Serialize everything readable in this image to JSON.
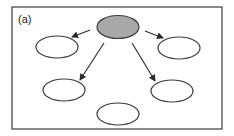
{
  "panel_label": "(a)",
  "colors": {
    "frame": "#4a4a4a",
    "root_fill": "#a8a8a8",
    "node_fill": "#ffffff",
    "edge": "#2a2a2a"
  },
  "nodes": [
    {
      "id": "root",
      "role": "source",
      "shaded": true,
      "label": ""
    },
    {
      "id": "top-left",
      "role": "target",
      "shaded": false,
      "label": ""
    },
    {
      "id": "top-right",
      "role": "target",
      "shaded": false,
      "label": ""
    },
    {
      "id": "mid-left",
      "role": "target",
      "shaded": false,
      "label": ""
    },
    {
      "id": "mid-right",
      "role": "target",
      "shaded": false,
      "label": ""
    },
    {
      "id": "bottom",
      "role": "isolated",
      "shaded": false,
      "label": ""
    }
  ],
  "edges": [
    {
      "from": "root",
      "to": "top-left",
      "directed": true
    },
    {
      "from": "root",
      "to": "top-right",
      "directed": true
    },
    {
      "from": "root",
      "to": "mid-left",
      "directed": true
    },
    {
      "from": "root",
      "to": "mid-right",
      "directed": true
    }
  ]
}
